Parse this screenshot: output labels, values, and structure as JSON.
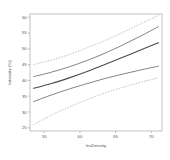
{
  "chart_data": {
    "type": "line",
    "title": "",
    "xlabel": "InvDensity",
    "ylabel": "Intensity (%)",
    "xlim": [
      53.0,
      71.5
    ],
    "ylim": [
      24.0,
      61.0
    ],
    "grid": false,
    "legend": null,
    "xticks": [
      55,
      60,
      65,
      70
    ],
    "xtick_labels": [
      "55",
      "60",
      "65",
      "70"
    ],
    "yticks": [
      25,
      30,
      35,
      40,
      45,
      50,
      55,
      60
    ],
    "ytick_labels": [
      "25",
      "30",
      "35",
      "40",
      "45",
      "50",
      "55",
      "60"
    ],
    "x": [
      53.5,
      56.0,
      58.5,
      61.0,
      63.5,
      66.0,
      68.5,
      71.0
    ],
    "series": [
      {
        "name": "upper prediction band",
        "style": "dashed",
        "color": "#a8a8a8",
        "values": [
          45.0,
          46.4,
          48.2,
          50.3,
          52.6,
          55.2,
          57.9,
          60.6
        ]
      },
      {
        "name": "upper confidence band",
        "style": "solid",
        "color": "#6e6e6e",
        "values": [
          41.2,
          42.6,
          44.3,
          46.3,
          48.6,
          51.2,
          54.0,
          57.0
        ]
      },
      {
        "name": "fitted regression line",
        "style": "solid",
        "color": "#4a4a4a",
        "values": [
          37.5,
          39.0,
          40.8,
          42.8,
          45.0,
          47.3,
          49.6,
          51.9
        ]
      },
      {
        "name": "lower confidence band",
        "style": "solid",
        "color": "#6e6e6e",
        "values": [
          33.3,
          35.4,
          37.3,
          39.0,
          40.6,
          42.0,
          43.3,
          44.5
        ]
      },
      {
        "name": "lower prediction band",
        "style": "dashed",
        "color": "#a8a8a8",
        "values": [
          26.0,
          29.0,
          31.6,
          33.9,
          36.0,
          37.8,
          39.4,
          40.8
        ]
      }
    ]
  }
}
